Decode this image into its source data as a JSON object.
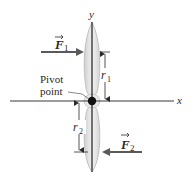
{
  "diagram": {
    "title": "",
    "axes": {
      "x_label": "x",
      "y_label": "y"
    },
    "pivot": {
      "label_line1": "Pivot",
      "label_line2": "point"
    },
    "forces": [
      {
        "name": "F",
        "subscript": "1",
        "direction": "right",
        "position": "upper blade, left side"
      },
      {
        "name": "F",
        "subscript": "2",
        "direction": "left",
        "position": "lower blade, right side"
      }
    ],
    "distances": [
      {
        "name": "r",
        "subscript": "1",
        "from": "pivot",
        "to": "F1 line of action"
      },
      {
        "name": "r",
        "subscript": "2",
        "from": "pivot",
        "to": "F2 line of action"
      }
    ],
    "colors": {
      "axis": "#3a3a3a",
      "blade_fill": "#e4e4e4",
      "blade_edge": "#b8b8b8",
      "arrow": "#5a5a5a",
      "pivot": "#111111",
      "text": "#2a2a2a"
    }
  }
}
